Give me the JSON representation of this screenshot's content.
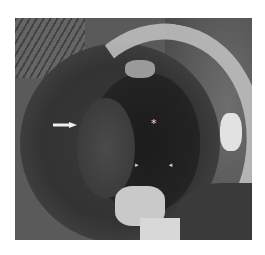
{
  "figure": {
    "annotations": {
      "arrow": "white-arrow",
      "asterisk": "*",
      "arrowheads": "▸ ◂"
    }
  }
}
